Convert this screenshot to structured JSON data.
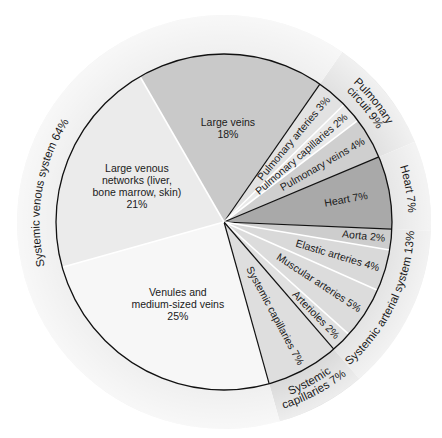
{
  "chart_data": {
    "type": "pie",
    "title": "",
    "center": [
      224,
      222
    ],
    "inner_radius": 168,
    "outer_radius": 207,
    "start_angle_deg": -30,
    "slices": [
      {
        "label": "Large veins",
        "value": 18,
        "lines": [
          "Large veins",
          "18%"
        ],
        "color": "#c9c9c9",
        "border": "none"
      },
      {
        "label": "Pulmonary arteries",
        "value": 3,
        "lines": [
          "Pulmonary arteries 3%"
        ],
        "color": "#e2e2e2",
        "border": "black"
      },
      {
        "label": "Pulmonary capillaries",
        "value": 2,
        "lines": [
          "Pulmonary capillaries 2%"
        ],
        "color": "#e9e9e9",
        "border": "white"
      },
      {
        "label": "Pulmonary veins",
        "value": 4,
        "lines": [
          "Pulmonary veins 4%"
        ],
        "color": "#cfcfcf",
        "border": "white"
      },
      {
        "label": "Heart",
        "value": 7,
        "lines": [
          "Heart 7%"
        ],
        "color": "#a9a9a9",
        "border": "black"
      },
      {
        "label": "Aorta",
        "value": 2,
        "lines": [
          "Aorta 2%"
        ],
        "color": "#cdcdcd",
        "border": "black"
      },
      {
        "label": "Elastic arteries",
        "value": 4,
        "lines": [
          "Elastic arteries 4%"
        ],
        "color": "#d9d9d9",
        "border": "white"
      },
      {
        "label": "Muscular arteries",
        "value": 5,
        "lines": [
          "Muscular arteries 5%"
        ],
        "color": "#dcdcdc",
        "border": "white"
      },
      {
        "label": "Arterioles",
        "value": 2,
        "lines": [
          "Arterioles 2%"
        ],
        "color": "#e0e0e0",
        "border": "white"
      },
      {
        "label": "Systemic capillaries",
        "value": 7,
        "lines": [
          "Systemic capillaries 7%"
        ],
        "color": "#dedede",
        "border": "black"
      },
      {
        "label": "Venules and medium-sized veins",
        "value": 25,
        "lines": [
          "Venules and",
          "medium-sized veins",
          "25%"
        ],
        "color": "#f7f7f7",
        "border": "black"
      },
      {
        "label": "Large venous networks (liver, bone marrow, skin)",
        "value": 21,
        "lines": [
          "Large venous",
          "networks (liver,",
          "bone marrow, skin)",
          "21%"
        ],
        "color": "#ebebeb",
        "border": "white"
      }
    ],
    "ring_groups": [
      {
        "label": "Pulmonary circuit 9%",
        "lines": [
          "Pulmonary",
          "circuit 9%"
        ],
        "value": 9,
        "start_index": 1,
        "end_index": 3,
        "color": "#e0e0e0"
      },
      {
        "label": "Heart 7%",
        "lines": [
          "Heart 7%"
        ],
        "value": 7,
        "start_index": 4,
        "end_index": 4,
        "color": "#e6e6e6"
      },
      {
        "label": "Systemic arterial system 13%",
        "lines": [
          "Systemic arterial system 13%"
        ],
        "value": 13,
        "start_index": 5,
        "end_index": 8,
        "color": "#e3e3e3"
      },
      {
        "label": "Systemic capillaries 7%",
        "lines": [
          "Systemic",
          "capillaries 7%"
        ],
        "value": 7,
        "start_index": 9,
        "end_index": 9,
        "color": "#d8d8d8"
      },
      {
        "label": "Systemic venous system 64%",
        "lines": [
          "Systemic venous system 64%"
        ],
        "value": 64,
        "start_index": 10,
        "end_index": 0,
        "color": "#efefef"
      }
    ]
  }
}
